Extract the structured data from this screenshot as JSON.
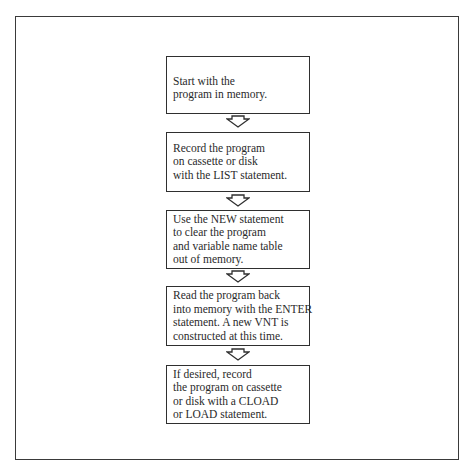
{
  "diagram": {
    "type": "flowchart",
    "direction": "top-to-bottom",
    "steps": [
      {
        "lines": [
          "Start with the",
          "program in memory."
        ]
      },
      {
        "lines": [
          "Record the program",
          "on cassette or disk",
          "with the LIST statement."
        ]
      },
      {
        "lines": [
          "Use the NEW statement",
          "to clear the program",
          "and variable name table",
          "out of memory."
        ]
      },
      {
        "lines": [
          "Read the program back",
          "into memory with the ENTER",
          "statement. A new VNT is",
          "constructed at this time."
        ]
      },
      {
        "lines": [
          "If desired, record",
          "the program on cassette",
          "or disk with a CLOAD",
          "or LOAD statement."
        ]
      }
    ],
    "connector_icon": "hollow-down-arrow"
  }
}
